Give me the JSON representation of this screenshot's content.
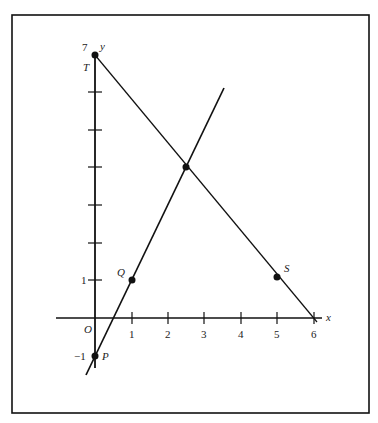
{
  "diagram": {
    "type": "coordinate-plane",
    "axes": {
      "x_label": "x",
      "y_label": "y",
      "origin_label": "O",
      "x_ticks": [
        "1",
        "2",
        "3",
        "4",
        "5",
        "6"
      ],
      "y_tick_labels": {
        "7": "7",
        "1": "1",
        "-1": "-1"
      }
    },
    "points": [
      {
        "name": "T",
        "x": 0,
        "y": 7
      },
      {
        "name": "Q",
        "x": 1,
        "y": 1
      },
      {
        "name": "S",
        "x": 5,
        "y": 1
      },
      {
        "name": "P",
        "x": 0,
        "y": -1
      },
      {
        "name": "",
        "x": 2.5,
        "y": 4
      }
    ],
    "lines": [
      {
        "name": "line-PQ",
        "through": [
          "P",
          "Q"
        ],
        "equation": "y = 2x - 1"
      },
      {
        "name": "line-TS",
        "through": [
          "T",
          "S"
        ],
        "equation": "y = 7 - 1.2x"
      }
    ],
    "colors": {
      "ink": "#111111",
      "background": "#ffffff"
    }
  }
}
